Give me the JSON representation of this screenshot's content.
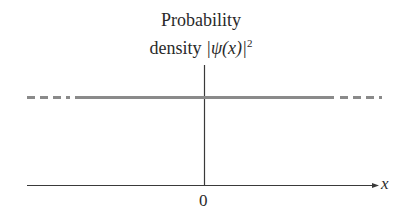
{
  "diagram": {
    "title_line1": "Probability",
    "title_line2_prefix": "density ",
    "title_line2_expr": "|ψ(x)|",
    "title_line2_sup": "2",
    "x_axis_label": "x",
    "origin_label": "0",
    "colors": {
      "axis": "#3a3a3a",
      "density_line": "#8a8a8a",
      "text": "#2a2a2a"
    },
    "density_line": {
      "style": "constant",
      "solid_segment": "finite region",
      "dashed_ends": "extends to ±infinity"
    }
  }
}
